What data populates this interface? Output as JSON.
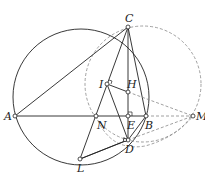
{
  "diagram": {
    "type": "geometry",
    "points": {
      "A": {
        "label": "A",
        "x": 15,
        "y": 116
      },
      "C": {
        "label": "C",
        "x": 128,
        "y": 27
      },
      "N": {
        "label": "N",
        "x": 96,
        "y": 116
      },
      "E": {
        "label": "E",
        "x": 128,
        "y": 116
      },
      "B": {
        "label": "B",
        "x": 146,
        "y": 116
      },
      "M": {
        "label": "M",
        "x": 193,
        "y": 116
      },
      "I": {
        "label": "I",
        "x": 107,
        "y": 84
      },
      "H": {
        "label": "H",
        "x": 128,
        "y": 92
      },
      "D": {
        "label": "D",
        "x": 128,
        "y": 140
      },
      "L": {
        "label": "L",
        "x": 80,
        "y": 159
      }
    },
    "solid_segments": [
      "AC",
      "AB",
      "CL",
      "CD",
      "CB",
      "ID",
      "IH",
      "LD",
      "NB"
    ],
    "dashed_segments": [
      "HM",
      "BM",
      "DM"
    ],
    "circles": {
      "main": {
        "style": "solid",
        "cx": 81,
        "cy": 97,
        "r": 68
      },
      "dashed_large": {
        "style": "dashed",
        "cx": 143,
        "cy": 84,
        "r": 58
      },
      "dashed_small": {
        "style": "dashed",
        "through": [
          "N",
          "D",
          "M"
        ]
      }
    },
    "right_angle_marks": [
      "I",
      "E",
      "D"
    ],
    "stroke_color": "#222222",
    "dashed_color": "#888888"
  }
}
